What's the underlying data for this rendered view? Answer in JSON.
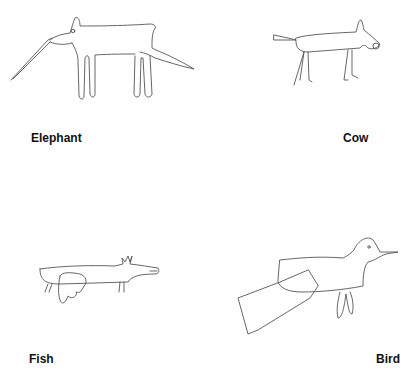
{
  "panels": [
    {
      "id": "elephant",
      "label": "Elephant",
      "icon": "elephant-drawing-icon"
    },
    {
      "id": "cow",
      "label": "Cow",
      "icon": "cow-drawing-icon"
    },
    {
      "id": "fish",
      "label": "Fish",
      "icon": "fish-drawing-icon"
    },
    {
      "id": "bird",
      "label": "Bird",
      "icon": "bird-drawing-icon"
    }
  ],
  "colors": {
    "background": "#ffffff",
    "line": "#555555",
    "text": "#111111"
  }
}
